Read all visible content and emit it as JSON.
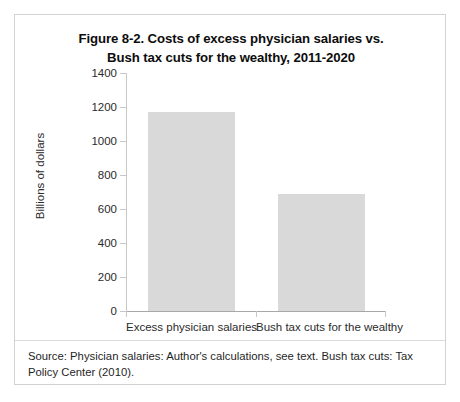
{
  "figure": {
    "title_line1": "Figure 8-2. Costs of excess physician salaries vs.",
    "title_line2": "Bush tax cuts for the wealthy, 2011-2020",
    "source_note": "Source: Physician salaries: Author's calculations, see text. Bush tax cuts: Tax Policy Center (2010)."
  },
  "chart_data": {
    "type": "bar",
    "title": "Figure 8-2. Costs of excess physician salaries vs. Bush tax cuts for the wealthy, 2011-2020",
    "categories": [
      "Excess physician salaries",
      "Bush tax cuts for the wealthy"
    ],
    "values": [
      1170,
      690
    ],
    "xlabel": "",
    "ylabel": "Billions of dollars",
    "ylim": [
      0,
      1400
    ],
    "ytick_step": 200,
    "yticks": [
      0,
      200,
      400,
      600,
      800,
      1000,
      1200,
      1400
    ],
    "ytick_labels": [
      "0",
      "200",
      "400",
      "600",
      "800",
      "1000",
      "1200",
      "1400"
    ],
    "grid": false,
    "legend": "none",
    "bar_color": "#d9d9d9",
    "axis_color": "#c8c8c8"
  }
}
